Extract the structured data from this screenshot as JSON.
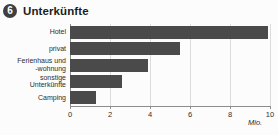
{
  "header": {
    "badge_number": "6",
    "title": "Unterkünfte"
  },
  "colors": {
    "bar": "#4a4a4a",
    "axis": "#8d8d8d",
    "grid": "#dcdcdc",
    "badge": "#3f3f3f",
    "background": "#fcfcfc",
    "text": "#2e2e2e"
  },
  "chart_data": {
    "type": "bar",
    "orientation": "horizontal",
    "title": "Unterkünfte",
    "categories": [
      "Hotel",
      "privat",
      "Ferienhaus und\n-wohnung",
      "sonstige\nUnterkünfte",
      "Camping"
    ],
    "values": [
      9.9,
      5.5,
      3.9,
      2.6,
      1.3
    ],
    "xlabel": "Mio.",
    "ylabel": "",
    "xlim": [
      0,
      10
    ],
    "xticks": [
      0,
      2,
      4,
      6,
      8,
      10
    ],
    "xtick_labels": [
      "0",
      "2",
      "4",
      "6",
      "8",
      "10"
    ],
    "grid": true,
    "grid_axis": "x",
    "legend": false,
    "unit": "Mio."
  }
}
